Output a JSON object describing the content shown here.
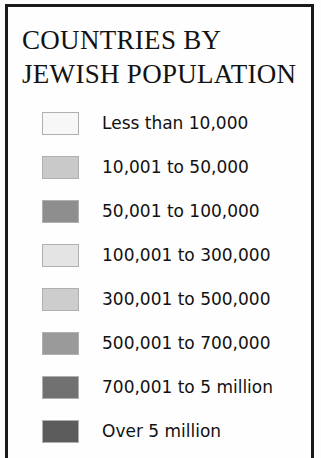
{
  "legend": {
    "title_lines": [
      "COUNTRIES BY",
      "JEWISH POPULATION"
    ],
    "items": [
      {
        "label": "Less than 10,000",
        "color": "#f7f7f7"
      },
      {
        "label": "10,001 to 50,000",
        "color": "#c9c9c9"
      },
      {
        "label": "50,001 to 100,000",
        "color": "#8e8e8e"
      },
      {
        "label": "100,001 to 300,000",
        "color": "#e4e4e4"
      },
      {
        "label": "300,001 to 500,000",
        "color": "#cdcdcd"
      },
      {
        "label": "500,001 to 700,000",
        "color": "#9a9a9a"
      },
      {
        "label": "700,001 to 5 million",
        "color": "#717171"
      },
      {
        "label": "Over 5 million",
        "color": "#5c5c5c"
      }
    ],
    "border_color": "#1a1a1a",
    "background_color": "#fefefe",
    "text_color": "#111111"
  },
  "chart_data": {
    "type": "table",
    "title": "COUNTRIES BY JEWISH POPULATION",
    "xlabel": "",
    "ylabel": "",
    "categories": [
      "Less than 10,000",
      "10,001 to 50,000",
      "50,001 to 100,000",
      "100,001 to 300,000",
      "300,001 to 500,000",
      "500,001 to 700,000",
      "700,001 to 5 million",
      "Over 5 million"
    ],
    "values": [
      {
        "bin_label": "Less than 10,000",
        "min": 0,
        "max": 10000,
        "swatch": "#f7f7f7"
      },
      {
        "bin_label": "10,001 to 50,000",
        "min": 10001,
        "max": 50000,
        "swatch": "#c9c9c9"
      },
      {
        "bin_label": "50,001 to 100,000",
        "min": 50001,
        "max": 100000,
        "swatch": "#8e8e8e"
      },
      {
        "bin_label": "100,001 to 300,000",
        "min": 100001,
        "max": 300000,
        "swatch": "#e4e4e4"
      },
      {
        "bin_label": "300,001 to 500,000",
        "min": 300001,
        "max": 500000,
        "swatch": "#cdcdcd"
      },
      {
        "bin_label": "500,001 to 700,000",
        "min": 500001,
        "max": 700000,
        "swatch": "#9a9a9a"
      },
      {
        "bin_label": "700,001 to 5 million",
        "min": 700001,
        "max": 5000000,
        "swatch": "#717171"
      },
      {
        "bin_label": "Over 5 million",
        "min": 5000001,
        "max": null,
        "swatch": "#5c5c5c"
      }
    ],
    "legend_position": "standalone",
    "grid": false
  }
}
